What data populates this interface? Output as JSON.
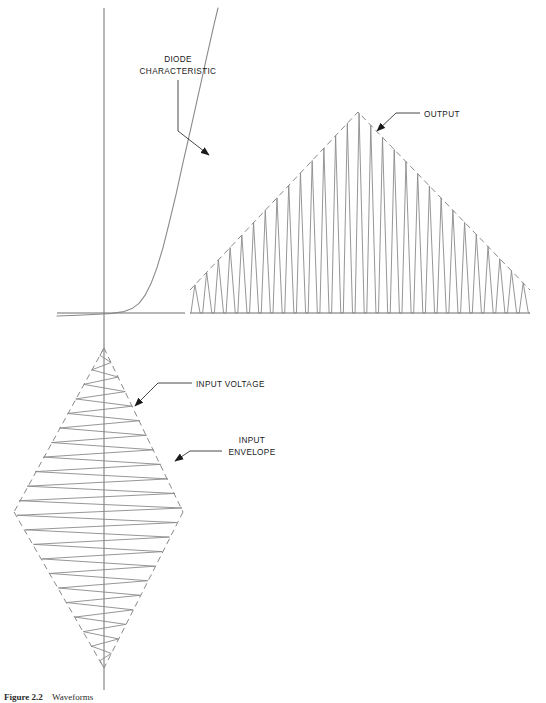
{
  "figure": {
    "background_color": "#ffffff",
    "line_color": "#8a8a8a",
    "axis_color": "#6f6f6f",
    "text_color": "#1a1a1a",
    "width": 546,
    "height": 703
  },
  "labels": {
    "diode_characteristic_line1": "DIODE",
    "diode_characteristic_line2": "CHARACTERISTIC",
    "output": "OUTPUT",
    "input_voltage": "INPUT VOLTAGE",
    "input_envelope_line1": "INPUT",
    "input_envelope_line2": "ENVELOPE"
  },
  "caption": {
    "number": "Figure 2.2",
    "text": "Waveforms"
  },
  "chart_data": {
    "type": "line",
    "panels": [
      {
        "name": "diode-characteristic",
        "type": "line",
        "description": "Exponential diode forward characteristic plotted on current-voltage axes",
        "xlabel": "",
        "ylabel": "",
        "axes": {
          "vertical_axis_x": 104,
          "vertical_axis_y_top": 8,
          "vertical_axis_y_bottom": 690,
          "horizontal_axis_y": 313,
          "horizontal_axis_x_start": 57,
          "horizontal_axis_x_end": 185
        },
        "curve_points": [
          [
            57,
            316
          ],
          [
            75,
            315
          ],
          [
            95,
            314
          ],
          [
            110,
            313
          ],
          [
            122,
            312
          ],
          [
            131,
            309
          ],
          [
            138,
            304
          ],
          [
            144,
            296
          ],
          [
            150,
            284
          ],
          [
            156,
            268
          ],
          [
            162,
            248
          ],
          [
            168,
            224
          ],
          [
            175,
            195
          ],
          [
            182,
            163
          ],
          [
            190,
            128
          ],
          [
            198,
            92
          ],
          [
            206,
            56
          ],
          [
            213,
            25
          ],
          [
            218,
            8
          ]
        ]
      },
      {
        "name": "output-waveform",
        "type": "line",
        "description": "Half-wave rectified pulse train with triangular dashed envelope",
        "baseline_y": 313,
        "x_start": 190,
        "x_end": 530,
        "peak_x": 358,
        "peak_y": 112,
        "pulse_count": 29,
        "envelope": {
          "style": "dashed",
          "points": [
            [
              190,
              290
            ],
            [
              358,
              112
            ],
            [
              530,
              290
            ]
          ]
        }
      },
      {
        "name": "input-waveform",
        "type": "line",
        "description": "Amplitude modulated carrier with diamond shaped dashed envelope centred on the vertical axis",
        "center_x": 104,
        "y_top": 348,
        "y_bottom": 668,
        "y_mid": 510,
        "max_half_width": 90,
        "cycle_count": 22,
        "envelope": {
          "style": "dashed",
          "upper_left": [
            [
              104,
              348
            ],
            [
              14,
              512
            ]
          ],
          "lower_left": [
            [
              14,
              512
            ],
            [
              104,
              668
            ]
          ],
          "upper_right": [
            [
              104,
              348
            ],
            [
              183,
              512
            ]
          ],
          "lower_right": [
            [
              183,
              512
            ],
            [
              104,
              668
            ]
          ]
        }
      }
    ]
  },
  "annotations": [
    {
      "name": "diode-characteristic-annotation",
      "label": "DIODE CHARACTERISTIC",
      "text_x": 160,
      "text_y": 62,
      "leader": [
        [
          178,
          78
        ],
        [
          178,
          130
        ],
        [
          213,
          158
        ]
      ],
      "arrow_at": [
        213,
        158
      ]
    },
    {
      "name": "output-annotation",
      "label": "OUTPUT",
      "text_x": 424,
      "text_y": 118,
      "leader": [
        [
          420,
          114
        ],
        [
          398,
          114
        ],
        [
          374,
          134
        ]
      ],
      "arrow_at": [
        374,
        134
      ]
    },
    {
      "name": "input-voltage-annotation",
      "label": "INPUT VOLTAGE",
      "text_x": 196,
      "text_y": 388,
      "leader": [
        [
          192,
          384
        ],
        [
          160,
          384
        ],
        [
          132,
          409
        ]
      ],
      "arrow_at": [
        132,
        409
      ]
    },
    {
      "name": "input-envelope-annotation",
      "label": "INPUT ENVELOPE",
      "text_x": 228,
      "text_y": 443,
      "leader": [
        [
          224,
          452
        ],
        [
          190,
          452
        ],
        [
          172,
          463
        ]
      ],
      "arrow_at": [
        172,
        463
      ]
    }
  ]
}
